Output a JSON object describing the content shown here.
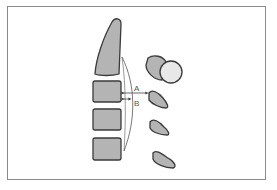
{
  "diagram": {
    "labels": {
      "a": "A",
      "b": "B"
    },
    "colors": {
      "bone_fill": "#b4b4b4",
      "bone_stroke": "#3a3a3a",
      "head_fill": "#e8e8e8",
      "frame": "#8a8a8a",
      "arrow": "#444444"
    }
  }
}
